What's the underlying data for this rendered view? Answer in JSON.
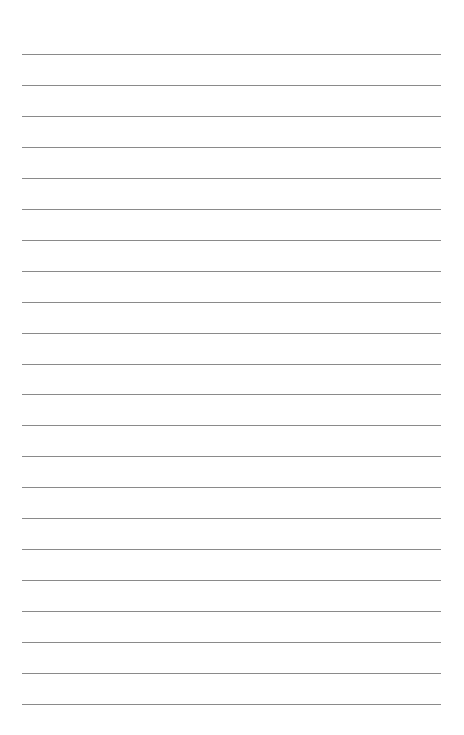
{
  "page": {
    "type": "lined-paper",
    "background_color": "#ffffff",
    "line_color": "#8a8a8a",
    "line_count": 22,
    "first_line_y": 54,
    "line_spacing": 30.95,
    "line_left": 22,
    "line_right": 441
  }
}
